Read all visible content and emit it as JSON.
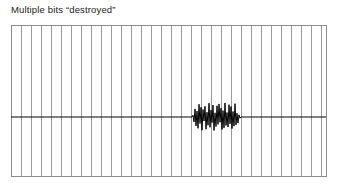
{
  "figure": {
    "title": "Multiple bits “destroyed”",
    "background_color": "#ffffff"
  },
  "plot": {
    "frame_color": "#8c8c8c",
    "gridline_color": "#9a9a9a",
    "signal_color": "#000000",
    "x_left_px": 11,
    "y_top_px": 25,
    "width_px": 316,
    "height_px": 152
  },
  "chart_data": {
    "type": "line",
    "title": "Multiple bits “destroyed”",
    "xlabel": "",
    "ylabel": "",
    "xlim": [
      0,
      316
    ],
    "ylim": [
      -1,
      1
    ],
    "grid": true,
    "grid_axis": "x",
    "grid_line_count": 31,
    "grid_spacing_px": 10,
    "legend": null,
    "annotations": [],
    "series": [
      {
        "name": "signal",
        "description": "flat baseline with a dense high-frequency noise burst near the center-right",
        "color": "#000000",
        "baseline_value": 0,
        "burst_x_start_px": 198,
        "burst_x_end_px": 244,
        "burst_y_top_px": 103,
        "burst_y_bottom_px": 132,
        "burst_center_y_px": 117,
        "values": [
          0.0,
          0.0,
          0.0,
          0.0,
          0.0,
          0.0,
          0.0,
          0.0,
          0.0,
          0.0,
          0.0,
          0.0,
          0.0,
          0.0,
          0.0,
          0.0,
          0.0,
          0.0,
          0.0,
          0.0,
          0.0,
          0.0,
          0.0,
          0.0,
          0.0,
          0.0,
          0.0,
          0.0,
          0.0,
          0.0,
          0.0,
          0.0,
          0.0,
          0.0,
          0.0,
          0.0,
          0.0,
          0.0,
          0.0,
          0.0,
          0.0,
          0.0,
          0.0,
          0.0,
          0.0,
          0.0,
          0.0,
          0.0,
          0.0,
          0.0,
          0.0,
          0.0,
          0.0,
          0.0,
          0.0,
          0.0,
          0.0,
          0.0,
          0.0,
          0.0,
          0.0,
          0.0,
          0.0,
          0.0,
          0.0,
          0.0,
          0.0,
          0.0,
          0.0,
          0.0,
          0.0,
          0.0,
          0.0,
          0.0,
          0.0,
          0.0,
          0.0,
          0.0,
          0.0,
          0.0,
          0.0,
          0.0,
          0.0,
          0.0,
          0.0,
          0.0,
          0.0,
          0.0,
          0.0,
          0.0,
          0.0,
          0.0,
          0.0,
          0.0,
          0.0,
          0.0,
          0.0,
          0.0,
          0.0,
          0.0,
          0.0,
          0.0,
          0.0,
          0.0,
          0.0,
          0.0,
          0.0,
          0.0,
          0.0,
          0.0,
          0.0,
          0.0,
          0.0,
          0.0,
          0.0,
          0.0,
          0.0,
          0.0,
          0.0,
          0.0,
          0.0,
          0.0,
          0.0,
          0.0,
          0.0,
          0.0,
          0.0,
          0.0,
          0.0,
          0.0,
          0.0,
          0.0,
          0.0,
          0.0,
          0.0,
          0.0,
          0.0,
          0.0,
          0.0,
          0.0,
          0.0,
          0.0,
          0.0,
          0.0,
          0.0,
          0.0,
          0.0,
          0.0,
          0.0,
          0.0,
          0.0,
          0.0,
          0.0,
          0.0,
          0.0,
          0.0,
          0.0,
          0.0,
          0.0,
          0.0,
          0.0,
          0.0,
          0.0,
          0.0,
          0.0,
          0.0,
          0.0,
          0.0,
          0.0,
          0.0,
          0.0,
          0.0,
          0.0,
          0.0,
          0.0,
          0.0,
          0.0,
          0.0,
          0.0,
          0.0,
          0.0,
          0.0,
          0.12,
          -0.34,
          0.56,
          -0.62,
          0.41,
          -0.78,
          0.88,
          -0.45,
          0.67,
          -0.91,
          0.52,
          -0.28,
          0.74,
          -0.84,
          0.33,
          -0.57,
          0.95,
          -0.71,
          0.48,
          -0.39,
          0.82,
          -0.93,
          0.29,
          -0.66,
          0.77,
          -0.51,
          0.9,
          -0.36,
          0.61,
          -0.86,
          0.44,
          -0.75,
          0.97,
          -0.58,
          0.31,
          -0.69,
          0.85,
          -0.47,
          0.72,
          -0.8,
          0.38,
          -0.63,
          0.92,
          -0.54,
          0.26,
          -0.42,
          0.15,
          -0.08,
          0.0,
          0.0,
          0.0,
          0.0,
          0.0,
          0.0,
          0.0,
          0.0,
          0.0,
          0.0,
          0.0,
          0.0,
          0.0,
          0.0,
          0.0,
          0.0,
          0.0,
          0.0,
          0.0,
          0.0,
          0.0,
          0.0,
          0.0,
          0.0,
          0.0,
          0.0,
          0.0,
          0.0,
          0.0,
          0.0,
          0.0,
          0.0,
          0.0,
          0.0,
          0.0,
          0.0,
          0.0,
          0.0,
          0.0,
          0.0,
          0.0,
          0.0,
          0.0,
          0.0,
          0.0,
          0.0,
          0.0,
          0.0,
          0.0,
          0.0,
          0.0,
          0.0,
          0.0,
          0.0,
          0.0,
          0.0,
          0.0,
          0.0,
          0.0,
          0.0,
          0.0,
          0.0,
          0.0,
          0.0,
          0.0,
          0.0,
          0.0,
          0.0,
          0.0,
          0.0,
          0.0,
          0.0,
          0.0,
          0.0,
          0.0,
          0.0,
          0.0,
          0.0,
          0.0,
          0.0,
          0.0,
          0.0,
          0.0,
          0.0,
          0.0,
          0.0
        ]
      }
    ]
  }
}
